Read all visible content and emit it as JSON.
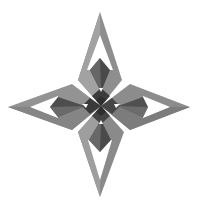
{
  "image": {
    "subject": "four-pointed star",
    "alt": "3D-rendered gray four-pointed star with hollow triangular arms and dark inner fins",
    "background": "#ffffff",
    "colors": {
      "light_face": "#9a9a9a",
      "mid_face": "#7d7d7d",
      "dark_face": "#555555",
      "darker_face": "#3f3f3f",
      "hole": "#ffffff"
    }
  }
}
